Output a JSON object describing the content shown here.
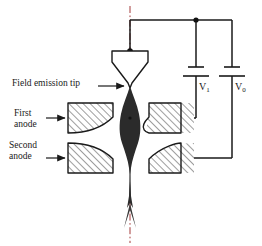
{
  "figure": {
    "background": "#ffffff",
    "line_color": "#1a1a1a",
    "beam_color": "#2b2b2b",
    "axis_color": "#b03a3a",
    "hatch_color": "#555555"
  },
  "labels": {
    "field_emission_tip": "Field emission tip",
    "first_anode_line1": "First",
    "first_anode_line2": "anode",
    "second_anode_line1": "Second",
    "second_anode_line2": "anode"
  },
  "circuit": {
    "battery_v1_label": "V",
    "battery_v1_sub": "1",
    "battery_v0_label": "V",
    "battery_v0_sub": "0",
    "junction_count": 4
  },
  "components": {
    "emitter_tip": "field-emission-tip",
    "first_anode_left": "first-anode-left-electrode",
    "first_anode_right": "first-anode-right-electrode",
    "second_anode_left": "second-anode-left-electrode",
    "second_anode_right": "second-anode-right-electrode",
    "electron_beam": "electron-beam-envelope",
    "optical_axis": "optical-axis-centerline"
  }
}
